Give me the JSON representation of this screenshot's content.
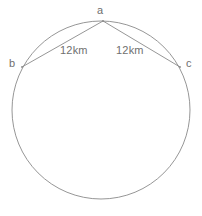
{
  "figure": {
    "type": "circle-with-inscribed-chords",
    "background_color": "#ffffff",
    "stroke_color": "#8a8a8a",
    "text_color": "#6f6f6f",
    "circle": {
      "center_x": 101,
      "center_y": 110,
      "radius": 89
    },
    "points": {
      "a": {
        "label": "a",
        "x": 103,
        "y": 21
      },
      "b": {
        "label": "b",
        "x": 22,
        "y": 67
      },
      "c": {
        "label": "c",
        "x": 180,
        "y": 67
      }
    },
    "segments": [
      {
        "name": "segment-ab",
        "from": "a",
        "to": "b",
        "label": "12km"
      },
      {
        "name": "segment-ac",
        "from": "a",
        "to": "c",
        "label": "12km"
      }
    ],
    "labels": {
      "point_a": "a",
      "point_b": "b",
      "point_c": "c",
      "chord_ab": "12km",
      "chord_ac": "12km"
    }
  }
}
